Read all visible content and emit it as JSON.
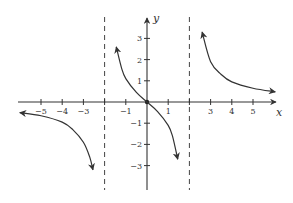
{
  "chart_data": {
    "type": "line",
    "title": "",
    "xlabel": "x",
    "ylabel": "y",
    "xlim": [
      -6.3,
      6.1
    ],
    "ylim": [
      -4,
      4
    ],
    "grid": false,
    "legend": null,
    "x_ticks": [
      -5,
      -4,
      -3,
      -1,
      1,
      3,
      4,
      5
    ],
    "x_tick_labels": [
      "−5",
      "−4",
      "−3",
      "−1",
      "1",
      "3",
      "4",
      "5"
    ],
    "y_ticks": [
      -3,
      -2,
      -1,
      1,
      2,
      3
    ],
    "y_tick_labels": [
      "−3",
      "−2",
      "−1",
      "1",
      "2",
      "3"
    ],
    "vertical_asymptotes": [
      -2,
      2
    ],
    "horizontal_asymptote": 0,
    "origin_marker": true,
    "series": [
      {
        "name": "left-branch",
        "points": [
          [
            -6.0,
            -0.5
          ],
          [
            -5.0,
            -0.65
          ],
          [
            -4.0,
            -0.95
          ],
          [
            -3.5,
            -1.3
          ],
          [
            -3.0,
            -1.9
          ],
          [
            -2.7,
            -2.6
          ],
          [
            -2.55,
            -3.2
          ]
        ],
        "arrows": "both"
      },
      {
        "name": "middle-branch",
        "points": [
          [
            -1.45,
            2.6
          ],
          [
            -1.2,
            1.6
          ],
          [
            -1.0,
            1.1
          ],
          [
            -0.5,
            0.45
          ],
          [
            0,
            0
          ],
          [
            0.5,
            -0.45
          ],
          [
            1.0,
            -1.1
          ],
          [
            1.2,
            -1.6
          ],
          [
            1.45,
            -2.7
          ]
        ],
        "arrows": "both"
      },
      {
        "name": "right-branch",
        "points": [
          [
            2.6,
            3.3
          ],
          [
            3.0,
            1.9
          ],
          [
            3.5,
            1.3
          ],
          [
            4.0,
            0.95
          ],
          [
            5.0,
            0.65
          ],
          [
            6.05,
            0.48
          ]
        ],
        "arrows": "both"
      }
    ]
  },
  "axes": {
    "x_name": "x",
    "y_name": "y"
  }
}
